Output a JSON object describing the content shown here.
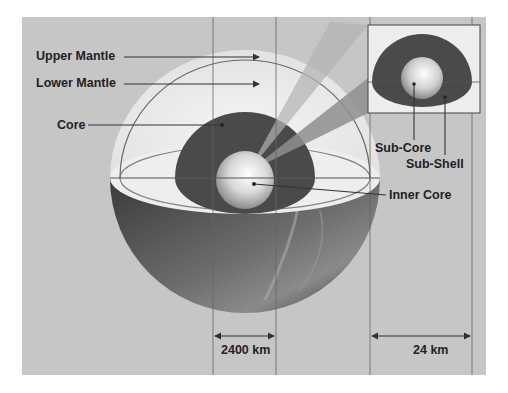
{
  "diagram": {
    "title": "",
    "colors": {
      "background_frame": "#c6c6c6",
      "mantle": "#ededed",
      "core": "#4a4a4a",
      "inner_core": "#e8e8e8",
      "earth_surface": "#555555",
      "line": "#444444",
      "label_text": "#222222"
    },
    "labels": {
      "upper_mantle": "Upper Mantle",
      "lower_mantle": "Lower Mantle",
      "core": "Core",
      "inner_core": "Inner Core",
      "sub_core": "Sub-Core",
      "sub_shell": "Sub-Shell"
    },
    "dimensions": {
      "earth_scale": "2400 km",
      "inset_scale": "24 km"
    },
    "inset": {
      "description": "Magnified view of inner core showing sub-core and sub-shell",
      "components": [
        "Sub-Core",
        "Sub-Shell"
      ]
    },
    "layers": [
      "Upper Mantle",
      "Lower Mantle",
      "Core",
      "Inner Core"
    ]
  }
}
